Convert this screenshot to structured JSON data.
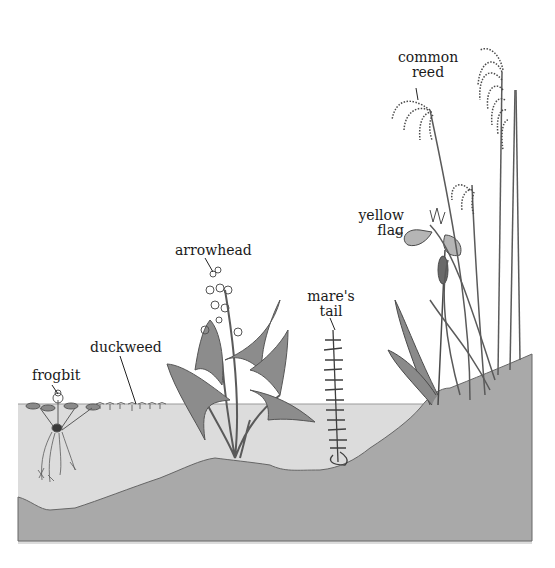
{
  "diagram": {
    "type": "cross-section illustration",
    "colors": {
      "background": "#ffffff",
      "water": "#dcdcdc",
      "ground": "#a9a9a9",
      "outline": "#555555",
      "plant": "#6e6e6e",
      "plant_dark": "#3f3f3f",
      "text": "#1a1a1a"
    }
  },
  "labels": {
    "frogbit": "frogbit",
    "duckweed": "duckweed",
    "arrowhead": "arrowhead",
    "mares_tail_line1": "mare's",
    "mares_tail_line2": "tail",
    "yellow_flag_line1": "yellow",
    "yellow_flag_line2": "flag",
    "common_reed_line1": "common",
    "common_reed_line2": "reed"
  }
}
